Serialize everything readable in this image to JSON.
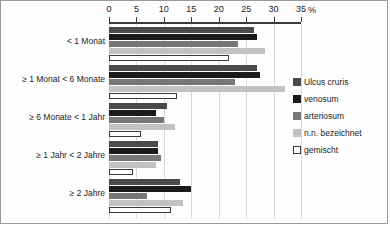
{
  "axis": {
    "unit_label": "%",
    "ticks": [
      0,
      5,
      10,
      15,
      20,
      25,
      30,
      35
    ]
  },
  "legend": {
    "entries": [
      {
        "label": "Ulcus cruris",
        "color": "#4a4a4a"
      },
      {
        "label": "venosum",
        "color": "#1a1a1a"
      },
      {
        "label": "arteriosum",
        "color": "#777777"
      },
      {
        "label": "n.n. bezeichnet",
        "color": "#c2c2c2"
      },
      {
        "label": "gemischt",
        "color": "#ffffff"
      }
    ]
  },
  "chart_data": {
    "type": "bar",
    "orientation": "horizontal",
    "title": "",
    "xlabel": "%",
    "ylabel": "",
    "xlim": [
      0,
      35
    ],
    "grid": true,
    "legend_position": "right",
    "categories": [
      "< 1 Monat",
      "≥ 1 Monat < 6 Monate",
      "≥ 6 Monate < 1 Jahr",
      "≥ 1 Jahr < 2 Jahre",
      "≥ 2 Jahre"
    ],
    "series": [
      {
        "name": "Ulcus cruris",
        "color": "#4a4a4a",
        "values": [
          26.5,
          27.0,
          10.5,
          9.0,
          13.0
        ]
      },
      {
        "name": "venosum",
        "color": "#1a1a1a",
        "values": [
          27.0,
          27.5,
          8.5,
          9.0,
          15.0
        ]
      },
      {
        "name": "arteriosum",
        "color": "#777777",
        "values": [
          23.5,
          23.0,
          10.0,
          9.5,
          7.0
        ]
      },
      {
        "name": "n.n. bezeichnet",
        "color": "#c2c2c2",
        "values": [
          28.5,
          32.0,
          12.0,
          8.5,
          13.5
        ]
      },
      {
        "name": "gemischt",
        "color": "#ffffff",
        "values": [
          21.5,
          12.0,
          5.5,
          4.0,
          11.0
        ]
      }
    ]
  }
}
